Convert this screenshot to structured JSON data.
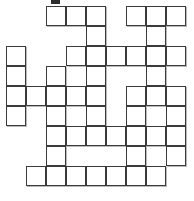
{
  "puzzle": {
    "title": "Crossword Grid",
    "type": "crossword-grid",
    "columns": 9,
    "rows": 9,
    "cell_size": 20,
    "origin_x": 6,
    "origin_y": 6,
    "colors": {
      "background": "#ffffff",
      "cell_fill": "#ffffff",
      "cell_border": "#3a3a3a",
      "cell_shadow": "#b9b9b9",
      "mark": "#2e2e2e"
    },
    "top_mark": {
      "x": 51,
      "y": 0,
      "width": 9,
      "height": 4
    },
    "grid_rows": [
      {
        "row": 0,
        "filled": [
          2,
          3,
          4,
          6,
          7,
          8
        ]
      },
      {
        "row": 1,
        "filled": [
          4,
          7
        ]
      },
      {
        "row": 2,
        "filled": [
          0,
          3,
          4,
          5,
          6,
          7,
          8
        ]
      },
      {
        "row": 3,
        "filled": [
          0,
          2,
          4,
          7
        ]
      },
      {
        "row": 4,
        "filled": [
          0,
          1,
          2,
          3,
          4,
          6,
          7,
          8
        ]
      },
      {
        "row": 5,
        "filled": [
          0,
          2,
          4,
          6,
          8
        ]
      },
      {
        "row": 6,
        "filled": [
          2,
          3,
          4,
          5,
          6,
          7,
          8
        ]
      },
      {
        "row": 7,
        "filled": [
          2,
          6,
          8
        ]
      },
      {
        "row": 8,
        "filled": [
          1,
          2,
          3,
          4,
          5,
          6,
          7
        ]
      }
    ],
    "cell_count": 53,
    "cell_labels": []
  }
}
